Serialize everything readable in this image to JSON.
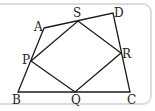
{
  "diagram": {
    "stroke_color": "#1a1a1a",
    "frame_color": "#dcdcdc",
    "points": {
      "A": {
        "label": "A",
        "x": 44,
        "y": 28
      },
      "D": {
        "label": "D",
        "x": 113,
        "y": 13
      },
      "C": {
        "label": "C",
        "x": 130,
        "y": 92
      },
      "B": {
        "label": "B",
        "x": 18,
        "y": 92
      },
      "S": {
        "label": "S",
        "x": 78,
        "y": 21
      },
      "R": {
        "label": "R",
        "x": 121,
        "y": 53
      },
      "Q": {
        "label": "Q",
        "x": 75,
        "y": 92
      },
      "P": {
        "label": "P",
        "x": 31,
        "y": 61
      }
    },
    "outer_quadrilateral": [
      "A",
      "D",
      "C",
      "B"
    ],
    "inner_quadrilateral": [
      "P",
      "S",
      "R",
      "Q"
    ]
  }
}
